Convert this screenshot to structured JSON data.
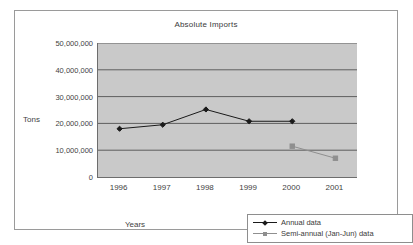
{
  "chart_data": {
    "type": "line",
    "title": "Absolute Imports",
    "xlabel": "Years",
    "ylabel": "Tons",
    "categories": [
      "1996",
      "1997",
      "1998",
      "1999",
      "2000",
      "2001"
    ],
    "ylim": [
      0,
      50000000
    ],
    "ytick_labels": [
      "50,000,000",
      "40,000,000",
      "30,000,000",
      "20,000,000",
      "10,000,000",
      "0"
    ],
    "ytick_values": [
      50000000,
      40000000,
      30000000,
      20000000,
      10000000,
      0
    ],
    "grid": "horizontal",
    "legend_position": "bottom-right",
    "plot_background": "#c9c9c9",
    "series": [
      {
        "name": "Annual data",
        "color": "#1a1a1a",
        "marker": "diamond",
        "x": [
          "1996",
          "1997",
          "1998",
          "1999",
          "2000"
        ],
        "values": [
          18000000,
          19500000,
          25200000,
          20800000,
          20800000
        ]
      },
      {
        "name": "Semi-annual (Jan-Jun) data",
        "color": "#8f8f8f",
        "marker": "square",
        "x": [
          "2000",
          "2001"
        ],
        "values": [
          11500000,
          7000000
        ]
      }
    ]
  },
  "legend": {
    "items": [
      {
        "label": "Annual data"
      },
      {
        "label": "Semi-annual (Jan-Jun) data"
      }
    ]
  }
}
